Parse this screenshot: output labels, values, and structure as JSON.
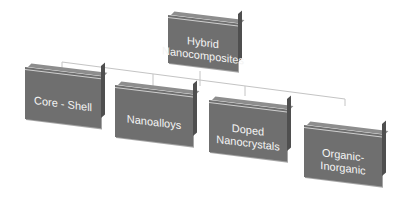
{
  "diagram": {
    "type": "hierarchy",
    "root": {
      "label": "Hybrid Nanocomposites"
    },
    "children": [
      {
        "label": "Core - Shell"
      },
      {
        "label": "Nanoalloys"
      },
      {
        "label": "Doped Nanocrystals"
      },
      {
        "label": "Organic-Inorganic"
      }
    ],
    "colors": {
      "box_fill": "#6f6f6f",
      "box_top": "#8d8d8d",
      "box_side": "#4f4f4f",
      "text": "#f4f4f4",
      "connector": "#c8c8c8"
    }
  }
}
